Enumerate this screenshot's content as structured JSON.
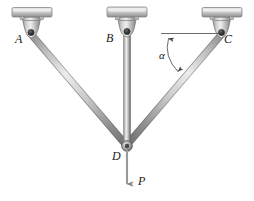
{
  "figure": {
    "name": "three-bar-truss-diagram",
    "background": "#ffffff",
    "width": 254,
    "height": 201
  },
  "labels": {
    "support_a": "A",
    "support_b": "B",
    "support_c": "C",
    "joint_d": "D",
    "load_p": "P",
    "angle_alpha": "α"
  },
  "colors": {
    "member_light": "#e8e8e8",
    "member_mid": "#a8a8a8",
    "member_dark": "#6f6f6f",
    "bracket_light": "#e2e2e2",
    "bracket_mid": "#b4b4b4",
    "bracket_dark": "#7b7b7b",
    "pin": "#3a3a3a",
    "annotation": "#555555",
    "text": "#1a1a1a"
  },
  "geometry": {
    "pin_a": [
      31,
      34
    ],
    "pin_b": [
      127,
      33
    ],
    "pin_c": [
      222,
      34
    ],
    "joint_d": [
      127,
      146
    ],
    "load_tip": [
      127,
      186
    ],
    "angle_vertex": [
      222,
      34
    ],
    "angle_ref_left": [
      161,
      34
    ],
    "angle_value_label": "α"
  },
  "members": [
    {
      "name": "member-ad",
      "from": "A",
      "to": "D"
    },
    {
      "name": "member-bd",
      "from": "B",
      "to": "D"
    },
    {
      "name": "member-cd",
      "from": "C",
      "to": "D"
    }
  ],
  "supports": [
    {
      "name": "support-bracket-a",
      "label": "A"
    },
    {
      "name": "support-bracket-b",
      "label": "B"
    },
    {
      "name": "support-bracket-c",
      "label": "C"
    }
  ]
}
